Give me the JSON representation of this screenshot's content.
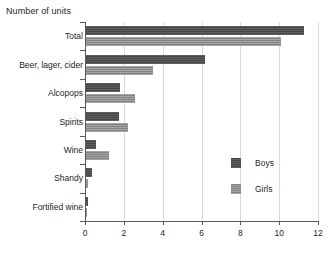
{
  "chart_data": {
    "type": "bar",
    "orientation": "horizontal",
    "title": "",
    "xlabel": "Number of units",
    "ylabel": "",
    "xlim": [
      0,
      12
    ],
    "xticks": [
      0,
      2,
      4,
      6,
      8,
      10,
      12
    ],
    "xticklabels": [
      "0",
      "2",
      "4",
      "6",
      "8",
      "10",
      "12"
    ],
    "grid": "vertical",
    "legend_position": "inside-right",
    "categories": [
      "Total",
      "Beer, lager, cider",
      "Alcopops",
      "Spirits",
      "Wine",
      "Shandy",
      "Fortified wine"
    ],
    "series": [
      {
        "name": "Boys",
        "color": "#4d4d4d",
        "values": [
          11.3,
          6.2,
          1.8,
          1.75,
          0.55,
          0.35,
          0.15
        ]
      },
      {
        "name": "Girls",
        "color": "#8c8c8c",
        "values": [
          10.1,
          3.5,
          2.6,
          2.2,
          1.25,
          0.15,
          0.1
        ]
      }
    ]
  },
  "axis": {
    "title": "Number of units"
  },
  "legend": {
    "items": [
      {
        "label": "Boys"
      },
      {
        "label": "Girls"
      }
    ]
  }
}
